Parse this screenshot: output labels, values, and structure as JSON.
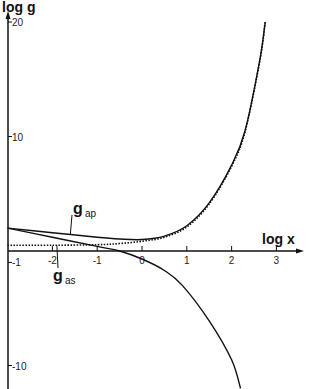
{
  "chart_data": {
    "type": "line",
    "title": "",
    "xlabel": "log x",
    "ylabel": "log g",
    "xlim": [
      -3,
      3.5
    ],
    "ylim": [
      -12,
      20
    ],
    "x_ticks": [
      -2,
      -1,
      0,
      1,
      2,
      3
    ],
    "x_tick_labels": [
      "-2",
      "-1",
      "0",
      "1",
      "2",
      "3"
    ],
    "y_ticks": [
      20,
      10,
      -1,
      -10
    ],
    "y_tick_labels": [
      "20",
      "10",
      "-1",
      "-10"
    ],
    "grid": false,
    "series": [
      {
        "name": "g_ap",
        "style": "solid",
        "x": [
          -3,
          -2,
          -1,
          -0.5,
          0,
          0.5,
          1,
          1.5,
          2,
          2.3,
          2.63,
          2.75
        ],
        "y": [
          2.0,
          1.6,
          1.2,
          1.05,
          1.0,
          1.3,
          2.2,
          4.2,
          7.5,
          10.5,
          16.7,
          20
        ]
      },
      {
        "name": "dotted",
        "style": "dotted",
        "x": [
          -3,
          -2,
          -1,
          -0.5,
          0,
          0.5,
          1,
          1.5,
          2,
          2.3,
          2.63,
          2.75
        ],
        "y": [
          0.5,
          0.5,
          0.55,
          0.65,
          0.85,
          1.2,
          2.1,
          4.1,
          7.4,
          10.4,
          16.6,
          20
        ]
      },
      {
        "name": "g_as",
        "style": "solid",
        "x": [
          -3,
          -2,
          -1,
          -0.5,
          0,
          0.5,
          0.9,
          1.5,
          2,
          2.2
        ],
        "y": [
          2.0,
          1.2,
          0.4,
          0.0,
          -0.7,
          -1.7,
          -3.0,
          -6.1,
          -9.5,
          -12
        ]
      }
    ],
    "annotations": [
      {
        "label": "g",
        "subscript": "ap",
        "points_to_x": -1.6,
        "points_to_y": 1.45
      },
      {
        "label": "g",
        "subscript": "as",
        "points_to_x": -1.9,
        "points_to_y": 0.5
      }
    ]
  }
}
